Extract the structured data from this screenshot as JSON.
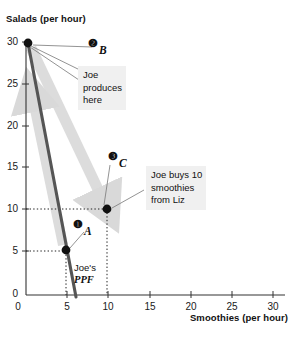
{
  "chart_data": {
    "type": "line",
    "title": "",
    "xlabel": "Smoothies (per hour)",
    "ylabel": "Salads (per hour)",
    "xlim": [
      0,
      33
    ],
    "ylim": [
      0,
      32
    ],
    "xticks": [
      "0",
      "5",
      "10",
      "15",
      "20",
      "25",
      "30"
    ],
    "yticks": [
      "0",
      "5",
      "10",
      "15",
      "20",
      "25",
      "30"
    ],
    "xtick_values": [
      0,
      5,
      10,
      15,
      20,
      25,
      30
    ],
    "ytick_values": [
      0,
      5,
      10,
      15,
      20,
      25,
      30
    ],
    "grid": false,
    "legend": "none",
    "series": [
      {
        "name": "Joe's PPF",
        "type": "line",
        "color": "#555555",
        "x": [
          0,
          6
        ],
        "y": [
          30,
          0
        ]
      }
    ],
    "points": [
      {
        "id": "A",
        "marker": "1",
        "x": 5,
        "y": 5,
        "label": "A",
        "bullet": "❶"
      },
      {
        "id": "B",
        "marker": "2",
        "x": 0,
        "y": 30,
        "label": "B",
        "bullet": "❷"
      },
      {
        "id": "C",
        "marker": "3",
        "x": 10,
        "y": 10,
        "label": "C",
        "bullet": "❸"
      }
    ],
    "annotations": [
      {
        "id": "joe-produces",
        "text": "Joe\nproduces\nhere",
        "lines": [
          "Joe",
          "produces",
          "here"
        ],
        "points_to": "B"
      },
      {
        "id": "joe-buys",
        "text": "Joe buys 10\nsmoothies\nfrom Liz",
        "lines": [
          "Joe buys 10",
          "smoothies",
          "from Liz"
        ],
        "points_to": "C"
      },
      {
        "id": "ppf-caption",
        "line1": "Joe's",
        "line2": "PPF"
      }
    ],
    "arrows": [
      {
        "id": "arrow-to-c",
        "from": [
          0,
          30
        ],
        "to": [
          10,
          10
        ],
        "color": "#d9d9d9"
      },
      {
        "id": "arrow-to-b",
        "from": [
          5,
          5
        ],
        "to": [
          0,
          30
        ],
        "color": "#d9d9d9"
      }
    ],
    "dotted_guides": [
      {
        "axis": "y",
        "value": 10,
        "from_x": 0,
        "to_x": 10
      },
      {
        "axis": "y",
        "value": 5,
        "from_x": 0,
        "to_x": 5
      },
      {
        "axis": "x",
        "value": 10,
        "from_y": 0,
        "to_y": 10
      },
      {
        "axis": "x",
        "value": 5,
        "from_y": 0,
        "to_y": 5
      }
    ],
    "colors": {
      "ppf_line": "#555555",
      "arrow": "#d9d9d9",
      "marker": "#111111",
      "callout_bg": "#f0f0f0",
      "axis": "#333333"
    }
  },
  "axes": {
    "y_title": "Salads (per hour)",
    "x_title": "Smoothies (per hour)"
  },
  "yticks": {
    "t0": "0",
    "t5": "5",
    "t10": "10",
    "t15": "15",
    "t20": "20",
    "t25": "25",
    "t30": "30"
  },
  "xticks": {
    "t0": "0",
    "t5": "5",
    "t10": "10",
    "t15": "15",
    "t20": "20",
    "t25": "25",
    "t30": "30"
  },
  "callouts": {
    "produces": {
      "l1": "Joe",
      "l2": "produces",
      "l3": "here"
    },
    "buys": {
      "l1": "Joe buys 10",
      "l2": "smoothies",
      "l3": "from Liz"
    }
  },
  "markers": {
    "one": "❶",
    "two": "❷",
    "three": "❸",
    "label_a": "A",
    "label_b": "B",
    "label_c": "C"
  },
  "ppf": {
    "line1": "Joe's",
    "line2": "PPF"
  }
}
